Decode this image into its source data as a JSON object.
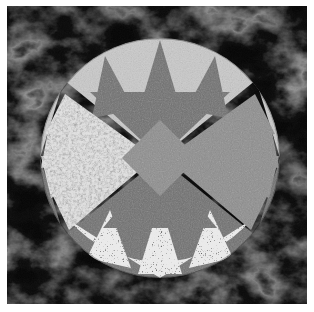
{
  "artwork": {
    "title": "Mariner's Compass Quilt Block",
    "type": "geometric-quilt-block",
    "description": "A radially symmetric eight-point compass star pieced from four quadrant fabrics inside a circle on a black marbled background.",
    "canvas": {
      "width": 314,
      "height": 312
    },
    "border": {
      "style": "thin-white-mat",
      "color": "#ffffff",
      "width_px": 7
    },
    "background": {
      "name": "black-marble-background",
      "base_color": "#070707",
      "vein_color": "#6a6a6a",
      "texture": "marbled"
    },
    "circle": {
      "name": "compass-circle",
      "center_x": 153,
      "center_y": 152,
      "radius": 120
    },
    "center_medallion": {
      "name": "center-diamond",
      "shape": "diamond",
      "color": "#8d8d8d",
      "texture": "fine-speckle",
      "half_width": 38,
      "half_height": 38
    },
    "fabrics": [
      {
        "key": "light_gray",
        "label": "Light Gray Solid",
        "color": "#c9c9c9",
        "texture": "fine-speckle"
      },
      {
        "key": "medium_gray",
        "label": "Medium Gray Solid",
        "color": "#8d8d8d",
        "texture": "fine-speckle"
      },
      {
        "key": "dark_gray",
        "label": "Dark Gray Solid",
        "color": "#6f6f6f",
        "texture": "fine-speckle"
      },
      {
        "key": "granite_light",
        "label": "Light Granite Print",
        "color": "#e3e3e3",
        "texture": "mottled-granite"
      },
      {
        "key": "confetti_light",
        "label": "Light Confetti Print",
        "color": "#ebebeb",
        "texture": "confetti-speckle"
      },
      {
        "key": "black_marble",
        "label": "Black Marble",
        "color": "#0b0b0b",
        "texture": "marbled"
      }
    ],
    "quadrants": [
      {
        "name": "top-segment",
        "position": "top",
        "background_fabric": "light_gray",
        "spike_fabric": "dark_gray",
        "spike_count": 3,
        "spike_direction": "outward-up"
      },
      {
        "name": "right-segment",
        "position": "right",
        "background_fabric": "black_marble",
        "spike_fabric": "medium_gray",
        "spike_count": 4,
        "spike_direction": "inward-left"
      },
      {
        "name": "bottom-segment",
        "position": "bottom",
        "background_fabric": "dark_gray",
        "spike_fabric": "confetti_light",
        "spike_count": 3,
        "spike_direction": "inward-up"
      },
      {
        "name": "left-segment",
        "position": "left",
        "background_fabric": "black_marble",
        "spike_fabric": "granite_light",
        "spike_count": 4,
        "spike_direction": "inward-right"
      }
    ]
  }
}
